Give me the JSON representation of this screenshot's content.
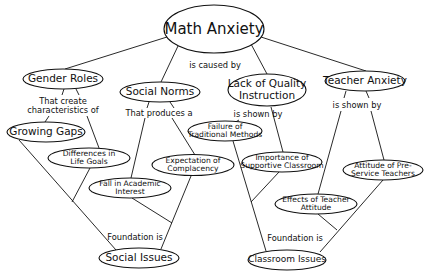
{
  "diagram": {
    "title": "Math Anxiety",
    "root": {
      "label": "Math Anxiety"
    },
    "root_link": "is caused by",
    "causes": [
      {
        "label": "Gender Roles",
        "link_line1": "That create",
        "link_line2": "characteristics of"
      },
      {
        "label": "Social Norms",
        "link_line1": "That produces a"
      },
      {
        "label_line1": "Lack of Quality",
        "label_line2": "Instruction",
        "link_line1": "is shown by"
      },
      {
        "label": "Teacher Anxiety",
        "link_line1": "is shown by"
      }
    ],
    "effects": {
      "growing_gaps": "Growing Gaps",
      "differences_line1": "Differences in",
      "differences_line2": "Life Goals",
      "fall_line1": "Fall in Academic",
      "fall_line2": "Interest",
      "expectation_line1": "Expectation of",
      "expectation_line2": "Complacency",
      "failure_line1": "Failure of",
      "failure_line2": "Traditional Methods",
      "importance_line1": "Importance of",
      "importance_line2": "Supportive Classroom",
      "attitude_line1": "Attitude of Pre-",
      "attitude_line2": "Service Teachers",
      "effects_line1": "Effects of Teacher",
      "effects_line2": "Attitude"
    },
    "foundations": [
      {
        "label": "Social Issues",
        "link": "Foundation is"
      },
      {
        "label": "Classroom Issues",
        "link": "Foundation is"
      }
    ]
  }
}
